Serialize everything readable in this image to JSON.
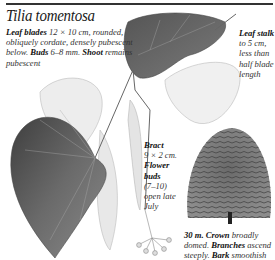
{
  "page": {
    "title": "Tilia tomentosa"
  },
  "description": {
    "leaf_blades_label": "Leaf blades",
    "leaf_blades_text": "12 × 10 cm, rounded, obliquely cordate, densely pubescent below.",
    "buds_label": "Buds",
    "buds_text": "6–8 mm.",
    "shoot_label": "Shoot",
    "shoot_text": "remains pubescent"
  },
  "leaf_stalk": {
    "label": "Leaf stalk",
    "text": "to 5 cm, less than half blade length"
  },
  "bract": {
    "label": "Bract",
    "text": "9 × 2 cm."
  },
  "flower_buds": {
    "label": "Flower buds",
    "text": "(7–10) open late July"
  },
  "tree": {
    "height": "30 m.",
    "crown_label": "Crown",
    "crown_text": "broadly domed.",
    "branches_label": "Branches",
    "branches_text": "ascend steeply.",
    "bark_label": "Bark",
    "bark_text": "smoothish"
  },
  "illustrations": {
    "large_leaf": "leaf-illustration",
    "small_leaf": "leaf-illustration",
    "bracts": "bract-illustration",
    "flower_cluster": "flower-buds-illustration",
    "tree": "tree-silhouette-illustration"
  },
  "colors": {
    "ink": "#222222",
    "leaf_dark": "#5a5a5a",
    "leaf_light": "#e6e6e6",
    "rule": "#333333"
  }
}
